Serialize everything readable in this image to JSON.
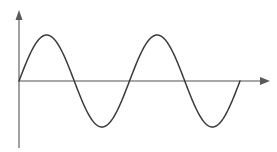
{
  "figure": {
    "name": "sine-wave-plot",
    "background_color": "#ffffff",
    "width": 277,
    "height": 152
  },
  "style": {
    "curve_color": "#3a3a3a",
    "axis_color": "#8a8a8a",
    "arrow_color": "#5a5a5a",
    "curve_width": 1.5,
    "axis_width": 1.6
  },
  "geometry": {
    "origin_x": 19,
    "origin_y": 81,
    "x_axis_end": 268,
    "y_axis_top": 12,
    "y_axis_bottom": 148,
    "amplitude_px": 46,
    "period_px": 110.5,
    "curve_start_x": 19,
    "curve_end_x": 240,
    "x_arrow_tip": 270,
    "y_arrow_tip": 10
  },
  "chart_data": {
    "type": "line",
    "title": "",
    "subtitle": "",
    "xlabel": "",
    "ylabel": "",
    "grid": false,
    "legend": null,
    "axes": {
      "x_axis_visible": true,
      "y_axis_visible": true,
      "x_axis_arrow": true,
      "y_axis_arrow": true,
      "x_tick_labels": [],
      "y_tick_labels": [],
      "xlim": [
        0,
        2.0
      ],
      "ylim": [
        -1.2,
        1.2
      ]
    },
    "series": [
      {
        "name": "sine",
        "function": "y = sin(2*pi*x)",
        "amplitude": 1,
        "cycles": 2,
        "phase": 0,
        "x": [
          0,
          0.125,
          0.25,
          0.375,
          0.5,
          0.625,
          0.75,
          0.875,
          1.0,
          1.125,
          1.25,
          1.375,
          1.5,
          1.625,
          1.75,
          1.875,
          2.0
        ],
        "values": [
          0,
          0.707,
          1,
          0.707,
          0,
          -0.707,
          -1,
          -0.707,
          0,
          0.707,
          1,
          0.707,
          0,
          -0.707,
          -1,
          -0.707,
          0
        ]
      }
    ],
    "annotations": [],
    "key_points": {
      "zero_crossings_x": [
        0,
        0.5,
        1.0,
        1.5,
        2.0
      ],
      "peaks_x": [
        0.25,
        1.25
      ],
      "troughs_x": [
        0.75,
        1.75
      ]
    }
  }
}
